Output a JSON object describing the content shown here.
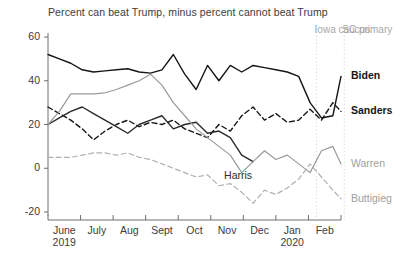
{
  "chart_data": {
    "type": "line",
    "title": "Percent can beat Trump, minus percent cannot beat Trump",
    "xlabel": "",
    "ylabel": "",
    "ylim": [
      -20,
      60
    ],
    "yticks": [
      60,
      40,
      20,
      0,
      -20
    ],
    "ytick_labels": [
      "60",
      "40",
      "20",
      "0",
      "-20"
    ],
    "xlim": [
      0,
      9
    ],
    "grid": false,
    "legend_position": "right-inline",
    "categories": [
      "June 2019",
      "July",
      "Aug",
      "Sept",
      "Oct",
      "Nov",
      "Dec",
      "Jan 2020",
      "Feb"
    ],
    "xtick_labels": [
      {
        "month": "June",
        "year": "2019"
      },
      {
        "month": "July",
        "year": ""
      },
      {
        "month": "Aug",
        "year": ""
      },
      {
        "month": "Sept",
        "year": ""
      },
      {
        "month": "Oct",
        "year": ""
      },
      {
        "month": "Nov",
        "year": ""
      },
      {
        "month": "Dec",
        "year": ""
      },
      {
        "month": "Jan",
        "year": "2020"
      },
      {
        "month": "Feb",
        "year": ""
      }
    ],
    "annotations": [
      {
        "label": "Iowa caucus",
        "x": 8.25,
        "color": "#a8a8a8",
        "style": "dotted-vline"
      },
      {
        "label": "SC primary",
        "x": 9.1,
        "color": "#a8a8a8",
        "style": "dotted-vline"
      },
      {
        "label": "Harris",
        "x": 5.9,
        "y": -3,
        "color": "#2a2a2a",
        "style": "inline-text"
      }
    ],
    "series": [
      {
        "name": "Biden",
        "color": "#151515",
        "dash": "solid",
        "label_side": "right",
        "x": [
          0,
          0.35,
          0.7,
          1.05,
          1.4,
          1.75,
          2.1,
          2.45,
          2.8,
          3.15,
          3.5,
          3.85,
          4.2,
          4.55,
          4.9,
          5.25,
          5.6,
          5.95,
          6.3,
          6.65,
          7.0,
          7.35,
          7.7,
          8.05,
          8.4,
          8.75,
          9.0
        ],
        "values": [
          52,
          50,
          48,
          45,
          44,
          44.5,
          45,
          45.5,
          44,
          43.5,
          45,
          52,
          43,
          36,
          47,
          40,
          47,
          44,
          47,
          46,
          45,
          44,
          42,
          30,
          23,
          24,
          42
        ]
      },
      {
        "name": "Sanders",
        "color": "#151515",
        "dash": "dashed",
        "label_side": "right",
        "x": [
          0,
          0.35,
          0.7,
          1.05,
          1.4,
          1.75,
          2.1,
          2.45,
          2.8,
          3.15,
          3.5,
          3.85,
          4.2,
          4.55,
          4.9,
          5.25,
          5.6,
          5.95,
          6.3,
          6.65,
          7.0,
          7.35,
          7.7,
          8.05,
          8.4,
          8.75,
          9.0
        ],
        "values": [
          28,
          25,
          22,
          18,
          13,
          17,
          20,
          22,
          19,
          21,
          20,
          22,
          18,
          16,
          14,
          20,
          17,
          24,
          28,
          22,
          25,
          21,
          22,
          27,
          22,
          30,
          26
        ]
      },
      {
        "name": "Harris",
        "color": "#2a2a2a",
        "dash": "solid",
        "label_side": "inline",
        "x": [
          0,
          0.35,
          0.7,
          1.05,
          1.4,
          1.75,
          2.1,
          2.45,
          2.8,
          3.15,
          3.5,
          3.85,
          4.2,
          4.55,
          4.9,
          5.25,
          5.6,
          5.95,
          6.3
        ],
        "values": [
          20,
          23,
          26,
          28,
          25,
          22,
          19,
          16,
          20,
          22,
          24,
          18,
          20,
          21,
          16,
          17,
          14,
          6,
          3
        ]
      },
      {
        "name": "Warren",
        "color": "#9a9a9a",
        "dash": "solid",
        "label_side": "right",
        "x": [
          0,
          0.35,
          0.7,
          1.05,
          1.4,
          1.75,
          2.1,
          2.45,
          2.8,
          3.15,
          3.5,
          3.85,
          4.2,
          4.55,
          4.9,
          5.25,
          5.6,
          5.95,
          6.3,
          6.65,
          7.0,
          7.35,
          7.7,
          8.05,
          8.4,
          8.75,
          9.0
        ],
        "values": [
          20,
          26,
          34,
          34,
          34,
          34.5,
          36,
          38,
          40,
          43,
          38,
          30,
          24,
          18,
          14,
          10,
          6,
          -2,
          3,
          8,
          4,
          6,
          2,
          -2,
          8,
          10,
          2
        ]
      },
      {
        "name": "Buttigieg",
        "color": "#b0b0b0",
        "dash": "dashed",
        "label_side": "right",
        "x": [
          0,
          0.35,
          0.7,
          1.05,
          1.4,
          1.75,
          2.1,
          2.45,
          2.8,
          3.15,
          3.5,
          3.85,
          4.2,
          4.55,
          4.9,
          5.25,
          5.6,
          5.95,
          6.3,
          6.65,
          7.0,
          7.35,
          7.7,
          8.05,
          8.4,
          8.75,
          9.0
        ],
        "values": [
          5,
          5,
          5,
          6,
          7,
          7,
          6,
          7,
          5,
          4,
          2,
          0,
          -2,
          -4,
          -3,
          -8,
          -7,
          -11,
          -16,
          -10,
          -12,
          -9,
          -5,
          2,
          -4,
          -10,
          -14
        ]
      }
    ]
  },
  "series_labels": [
    {
      "name": "Biden"
    },
    {
      "name": "Sanders"
    },
    {
      "name": "Warren"
    },
    {
      "name": "Buttigieg"
    }
  ]
}
